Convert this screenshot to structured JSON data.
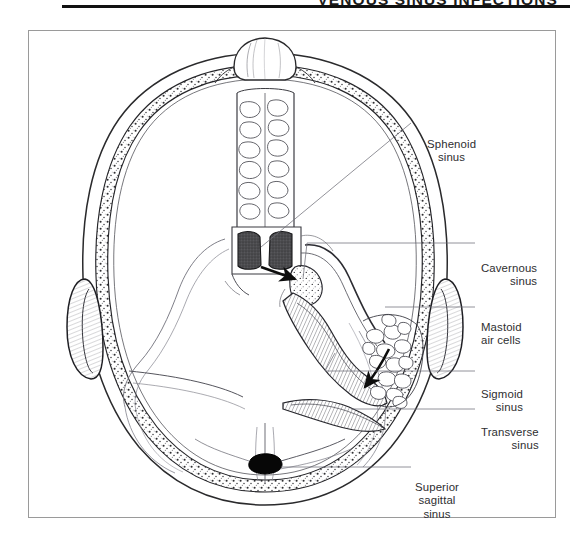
{
  "header": {
    "running_title": "VENOUS SINUS INFECTIONS"
  },
  "figure": {
    "title": "",
    "view": "axial-section-of-skull-base",
    "labels": [
      {
        "id": "sphenoid",
        "lines": [
          "Sphenoid",
          "sinus"
        ],
        "align": "center"
      },
      {
        "id": "cavernous",
        "lines": [
          "Cavernous",
          "sinus"
        ],
        "align": "right"
      },
      {
        "id": "mastoid",
        "lines": [
          "Mastoid",
          "air cells"
        ],
        "align": "left"
      },
      {
        "id": "sigmoid",
        "lines": [
          "Sigmoid",
          "sinus"
        ],
        "align": "right"
      },
      {
        "id": "transverse",
        "lines": [
          "Transverse",
          "sinus"
        ],
        "align": "right"
      },
      {
        "id": "sagittal",
        "lines": [
          "Superior",
          "sagittal",
          "sinus"
        ],
        "align": "center"
      }
    ]
  },
  "colors": {
    "ink": "#1a1a1a",
    "label_text": "#2e2e30",
    "frame_border": "#9a9a9a",
    "rule": "#111111",
    "sphenoid_fill": "#4d4d50",
    "sagittal_fill": "#070707",
    "line_light": "#7c7c80",
    "page_background": "#ffffff"
  }
}
